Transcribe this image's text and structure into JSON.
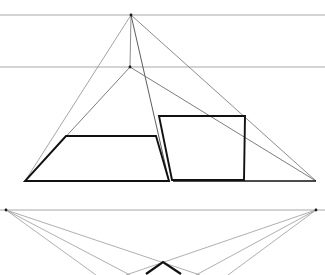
{
  "document": {
    "title": "Perspective Construction Drawing",
    "background_color": "#ffffff",
    "width": 325,
    "height": 275
  },
  "palette": {
    "horizon_line": "#a8a8a8",
    "construction_line": "#6e6e6e",
    "light_construction_line": "#9a9a9a",
    "object_line": "#111111",
    "vertex_dot": "#1a1a1a"
  },
  "guides": {
    "horizon_lines": [
      {
        "name": "upper-horizon-line",
        "y": 15,
        "x1": 0,
        "x2": 325,
        "color": "#a8a8a8",
        "width": 1
      },
      {
        "name": "middle-horizon-line",
        "y": 67,
        "x1": 0,
        "x2": 325,
        "color": "#a8a8a8",
        "width": 1
      },
      {
        "name": "lower-horizon-line",
        "y": 210,
        "x1": 0,
        "x2": 325,
        "color": "#a8a8a8",
        "width": 1
      }
    ],
    "vanishing_points": [
      {
        "name": "upper-apex-point",
        "x": 131,
        "y": 15
      },
      {
        "name": "secondary-apex-point",
        "x": 130,
        "y": 67
      },
      {
        "name": "left-vanishing-point",
        "x": 6,
        "y": 210
      },
      {
        "name": "right-vanishing-point",
        "x": 316,
        "y": 210
      }
    ]
  },
  "construction_rays": [
    {
      "name": "ray-apex-to-left-base",
      "x1": 131,
      "y1": 15,
      "x2": 25,
      "y2": 181,
      "color": "#8d8d8d",
      "width": 0.8
    },
    {
      "name": "ray-apex-to-right-base",
      "x1": 131,
      "y1": 15,
      "x2": 316,
      "y2": 181,
      "color": "#6e6e6e",
      "width": 0.8
    },
    {
      "name": "ray-apex-vertical-drop",
      "x1": 131,
      "y1": 15,
      "x2": 130,
      "y2": 67,
      "color": "#6e6e6e",
      "width": 0.8
    },
    {
      "name": "ray-apex-to-inner-edge",
      "x1": 131,
      "y1": 15,
      "x2": 169,
      "y2": 181,
      "color": "#4a4a4a",
      "width": 0.9
    },
    {
      "name": "ray-secondary-apex-to-left-base",
      "x1": 130,
      "y1": 67,
      "x2": 25,
      "y2": 181,
      "color": "#6e6e6e",
      "width": 0.9
    },
    {
      "name": "ray-secondary-apex-to-right-base",
      "x1": 130,
      "y1": 67,
      "x2": 316,
      "y2": 181,
      "color": "#6e6e6e",
      "width": 0.9
    },
    {
      "name": "ray-left-vp-to-lower-left",
      "x1": 6,
      "y1": 210,
      "x2": 130,
      "y2": 275,
      "color": "#9a9a9a",
      "width": 0.8
    },
    {
      "name": "ray-left-vp-to-lower-center",
      "x1": 6,
      "y1": 210,
      "x2": 200,
      "y2": 275,
      "color": "#9a9a9a",
      "width": 0.8
    },
    {
      "name": "ray-left-vp-to-lower-far",
      "x1": 6,
      "y1": 210,
      "x2": 96,
      "y2": 275,
      "color": "#9a9a9a",
      "width": 0.8
    },
    {
      "name": "ray-right-vp-to-lower-right",
      "x1": 316,
      "y1": 210,
      "x2": 196,
      "y2": 275,
      "color": "#9a9a9a",
      "width": 0.8
    },
    {
      "name": "ray-right-vp-to-lower-center",
      "x1": 316,
      "y1": 210,
      "x2": 126,
      "y2": 275,
      "color": "#9a9a9a",
      "width": 0.8
    },
    {
      "name": "ray-right-vp-to-lower-far",
      "x1": 316,
      "y1": 210,
      "x2": 228,
      "y2": 275,
      "color": "#9a9a9a",
      "width": 0.8
    }
  ],
  "shapes": {
    "main_triangle": {
      "name": "main-triangle",
      "apex": {
        "x": 131,
        "y": 15
      },
      "base_left": {
        "x": 25,
        "y": 181
      },
      "base_right": {
        "x": 316,
        "y": 181
      },
      "base_color": "#111111",
      "base_width": 1.6
    },
    "left_trapezoid": {
      "name": "left-trapezoid-face",
      "points": "66,136 156,136 169,181 25,181",
      "stroke": "#111111",
      "stroke_width": 1.9
    },
    "right_parallelogram": {
      "name": "right-parallelogram-face",
      "points": "159,116 245,116 244,180 172,180",
      "stroke": "#111111",
      "stroke_width": 1.9
    },
    "lower_chevron": {
      "name": "lower-chevron-mark",
      "points": "146,274 163,262 181,274",
      "stroke": "#111111",
      "stroke_width": 2.2
    }
  },
  "base_segments": [
    {
      "name": "base-left-segment",
      "x1": 25,
      "y1": 181,
      "x2": 166,
      "y2": 181,
      "color": "#111111",
      "width": 1.6
    },
    {
      "name": "base-right-segment",
      "x1": 173,
      "y1": 181,
      "x2": 316,
      "y2": 181,
      "color": "#111111",
      "width": 1.6
    }
  ],
  "edges": {
    "triangle_left_edge": {
      "name": "triangle-left-edge",
      "x1": 131,
      "y1": 15,
      "x2": 25,
      "y2": 181
    },
    "triangle_right_edge": {
      "name": "triangle-right-edge",
      "x1": 131,
      "y1": 15,
      "x2": 316,
      "y2": 181
    }
  }
}
